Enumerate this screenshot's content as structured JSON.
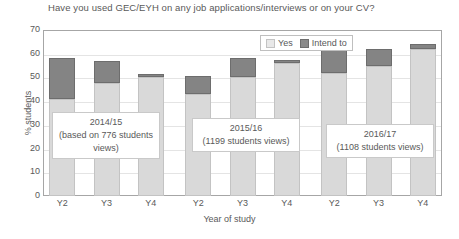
{
  "chart_data": {
    "type": "bar",
    "subtype": "stacked-bar",
    "title": "Have you used GEC/EYH on any job applications/interviews or on your CV?",
    "xlabel": "Year of study",
    "ylabel": "% students",
    "ylim": [
      0,
      70
    ],
    "ytick_step": 10,
    "yticks": [
      70,
      60,
      50,
      40,
      30,
      20,
      10,
      0
    ],
    "grid": true,
    "legend_position": "top-center-right",
    "categories": [
      "Y2",
      "Y3",
      "Y4",
      "Y2",
      "Y3",
      "Y4",
      "Y2",
      "Y3",
      "Y4"
    ],
    "series": [
      {
        "name": "Yes",
        "color": "#d9d9d9",
        "values": [
          41,
          47.5,
          50,
          43,
          50,
          56,
          52,
          55,
          62
        ]
      },
      {
        "name": "Intend to",
        "color": "#848484",
        "values": [
          17,
          9.5,
          1.5,
          7.5,
          8,
          1.5,
          14,
          7,
          2
        ]
      }
    ],
    "totals": [
      58,
      57,
      51.5,
      50.5,
      58,
      57.5,
      66,
      62,
      64
    ],
    "groups": [
      {
        "label": "2014/15",
        "sublabel": "(based on 776 students",
        "sublabel2": "views)",
        "categories": [
          "Y2",
          "Y3",
          "Y4"
        ]
      },
      {
        "label": "2015/16",
        "sublabel": "(1199 students views)",
        "sublabel2": "",
        "categories": [
          "Y2",
          "Y3",
          "Y4"
        ]
      },
      {
        "label": "2016/17",
        "sublabel": "(1108 students views)",
        "sublabel2": "",
        "categories": [
          "Y2",
          "Y3",
          "Y4"
        ]
      }
    ],
    "annotations": [
      "2014/15 (based on 776 students views)",
      "2015/16 (1199 students views)",
      "2016/17 (1108 students views)"
    ]
  },
  "legend": {
    "items": [
      {
        "label": "Yes",
        "color": "#d9d9d9"
      },
      {
        "label": "Intend to",
        "color": "#848484"
      }
    ]
  },
  "colors": {
    "yes": "#d9d9d9",
    "intend_to": "#848484",
    "grid": "#e4e4e4",
    "axis": "#a6a6a6",
    "text": "#595959",
    "background": "#ffffff"
  }
}
